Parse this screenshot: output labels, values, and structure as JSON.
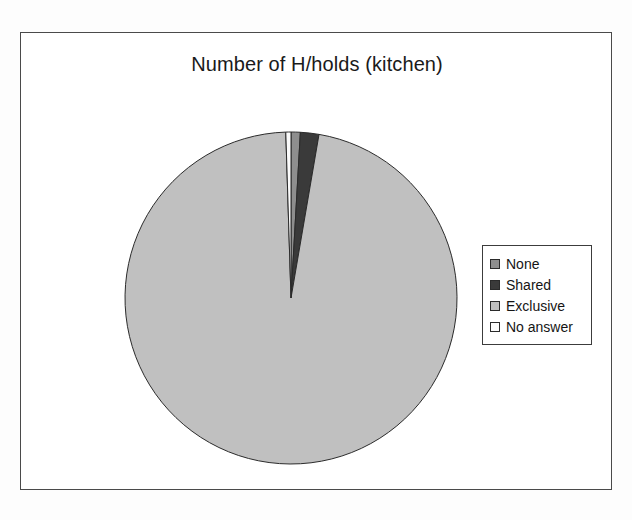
{
  "chart_data": {
    "type": "pie",
    "title": "Number of H/holds (kitchen)",
    "xlabel": "",
    "ylabel": "",
    "legend_position": "right",
    "grid": false,
    "start_angle_deg": 0,
    "direction": "clockwise",
    "categories": [
      "None",
      "Shared",
      "Exclusive",
      "No answer"
    ],
    "values": [
      0.9,
      1.8,
      96.8,
      0.5
    ],
    "value_unit": "percent",
    "colors": [
      "#8e8e8e",
      "#3a3a3a",
      "#c0c0c0",
      "#fafafa"
    ],
    "slices": [
      {
        "label": "None",
        "value": 0.9,
        "color": "#8e8e8e"
      },
      {
        "label": "Shared",
        "value": 1.8,
        "color": "#3a3a3a"
      },
      {
        "label": "Exclusive",
        "value": 96.8,
        "color": "#c0c0c0"
      },
      {
        "label": "No answer",
        "value": 0.5,
        "color": "#fafafa"
      }
    ]
  },
  "legend": {
    "items": [
      {
        "label": "None",
        "color": "#8e8e8e"
      },
      {
        "label": "Shared",
        "color": "#3a3a3a"
      },
      {
        "label": "Exclusive",
        "color": "#c0c0c0"
      },
      {
        "label": "No answer",
        "color": "#fafafa"
      }
    ]
  },
  "style": {
    "slice_outline": "#2b2b2b",
    "frame_border": "#4a4a4a",
    "legend_border": "#3c3c3c",
    "background": "#ffffff",
    "title_color": "#1a1a1a"
  }
}
